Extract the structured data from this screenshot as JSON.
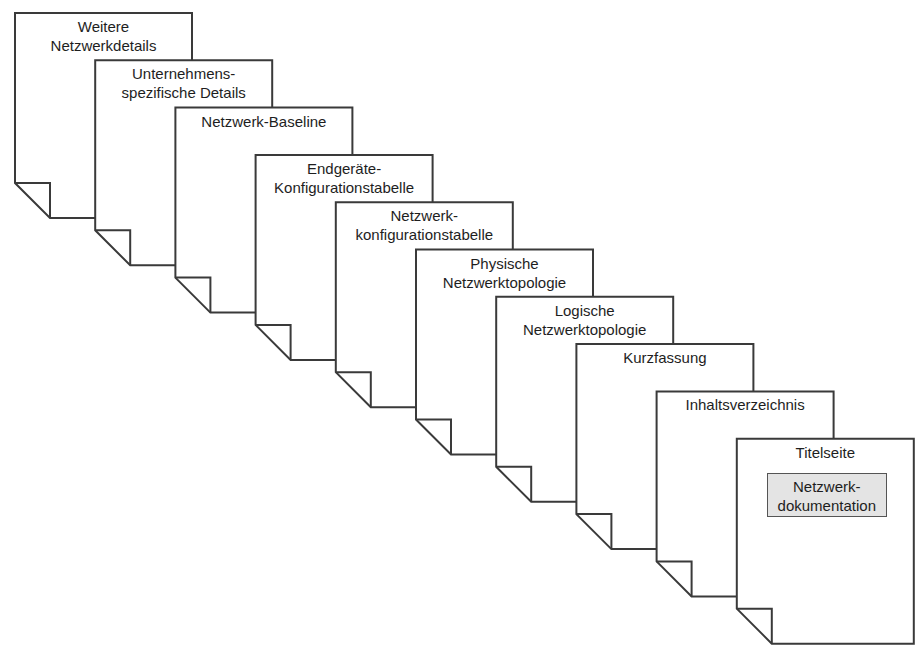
{
  "diagram": {
    "type": "stacked-document-pages",
    "stroke_color": "#3a3a3a",
    "page_fill": "#ffffff",
    "title_box_fill": "#e4e4e4",
    "pages": [
      {
        "lines": [
          "Weitere",
          "Netzwerkdetails"
        ]
      },
      {
        "lines": [
          "Unternehmens-",
          "spezifische Details"
        ]
      },
      {
        "lines": [
          "Netzwerk-Baseline"
        ]
      },
      {
        "lines": [
          "Endgeräte-",
          "Konfigurationstabelle"
        ]
      },
      {
        "lines": [
          "Netzwerk-",
          "konfigurationstabelle"
        ]
      },
      {
        "lines": [
          "Physische",
          "Netzwerktopologie"
        ]
      },
      {
        "lines": [
          "Logische",
          "Netzwerktopologie"
        ]
      },
      {
        "lines": [
          "Kurzfassung"
        ]
      },
      {
        "lines": [
          "Inhaltsverzeichnis"
        ]
      },
      {
        "lines": [
          "Titelseite"
        ],
        "title_box": [
          "Netzwerk-",
          "dokumentation"
        ]
      }
    ]
  }
}
